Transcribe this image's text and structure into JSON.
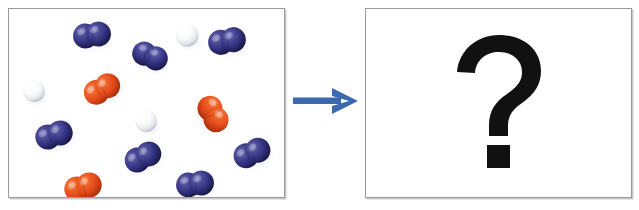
{
  "figure": {
    "type": "chemistry-reaction-diagram",
    "background_color": "#ffffff"
  },
  "panels": {
    "before": {
      "name": "reactant-mixture-panel",
      "border_color": "#9a9a9a",
      "background_color": "#ffffff"
    },
    "after": {
      "name": "product-unknown-panel",
      "border_color": "#9a9a9a",
      "background_color": "#ffffff",
      "content_label": "?"
    }
  },
  "arrow": {
    "name": "reaction-arrow",
    "direction": "right",
    "color": "#3a69b0"
  },
  "legend_colors": {
    "blue_atom": "#2e2d7a",
    "blue_atom_highlight": "#6f6fb8",
    "blue_atom_shadow": "#191845",
    "orange_atom": "#e44a17",
    "orange_atom_highlight": "#f59a6a",
    "orange_atom_shadow": "#a62f08",
    "white_atom": "#ffffff",
    "white_atom_highlight": "#ffffff",
    "white_atom_shadow": "#b9bcc4",
    "question_mark": "#111111"
  },
  "molecule_counts": {
    "blue_diatomic": 7,
    "orange_diatomic": 3,
    "white_monatomic": 3,
    "total": 13
  },
  "molecules": [
    {
      "id": "blue-diatomic-1",
      "species": "blue",
      "atoms": 2,
      "x": 83,
      "y": 26,
      "r": 12.5,
      "rot": -8
    },
    {
      "id": "blue-diatomic-2",
      "species": "blue",
      "atoms": 2,
      "x": 141,
      "y": 47,
      "r": 12.0,
      "rot": 22
    },
    {
      "id": "blue-diatomic-3",
      "species": "blue",
      "atoms": 2,
      "x": 218,
      "y": 32,
      "r": 12.5,
      "rot": -12
    },
    {
      "id": "blue-diatomic-4",
      "species": "blue",
      "atoms": 2,
      "x": 45,
      "y": 126,
      "r": 12.5,
      "rot": -18
    },
    {
      "id": "blue-diatomic-5",
      "species": "blue",
      "atoms": 2,
      "x": 134,
      "y": 148,
      "r": 12.5,
      "rot": -28
    },
    {
      "id": "blue-diatomic-6",
      "species": "blue",
      "atoms": 2,
      "x": 243,
      "y": 144,
      "r": 12.5,
      "rot": -25
    },
    {
      "id": "blue-diatomic-7",
      "species": "blue",
      "atoms": 2,
      "x": 186,
      "y": 175,
      "r": 12.5,
      "rot": -8
    },
    {
      "id": "orange-diatomic-1",
      "species": "orange",
      "atoms": 2,
      "x": 93,
      "y": 80,
      "r": 12.5,
      "rot": -30
    },
    {
      "id": "orange-diatomic-2",
      "species": "orange",
      "atoms": 2,
      "x": 204,
      "y": 105,
      "r": 12.5,
      "rot": 62
    },
    {
      "id": "orange-diatomic-3",
      "species": "orange",
      "atoms": 2,
      "x": 74,
      "y": 178,
      "r": 12.5,
      "rot": -18
    },
    {
      "id": "white-atom-1",
      "species": "white",
      "atoms": 1,
      "x": 178,
      "y": 26,
      "r": 11.5,
      "rot": 0
    },
    {
      "id": "white-atom-2",
      "species": "white",
      "atoms": 1,
      "x": 25,
      "y": 82,
      "r": 11.0,
      "rot": 0
    },
    {
      "id": "white-atom-3",
      "species": "white",
      "atoms": 1,
      "x": 137,
      "y": 112,
      "r": 11.0,
      "rot": 0
    }
  ]
}
